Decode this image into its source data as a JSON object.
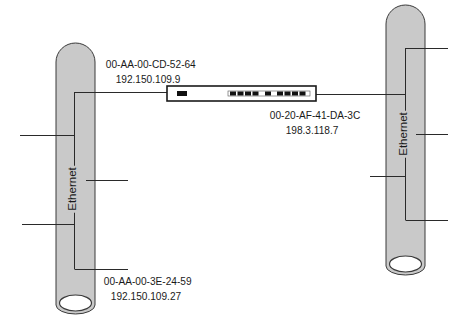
{
  "diagram": {
    "segments": [
      {
        "id": "left",
        "label": "Ethernet"
      },
      {
        "id": "right",
        "label": "Ethernet"
      }
    ],
    "switch": {
      "name": "switch",
      "ports": 11
    },
    "nodes": [
      {
        "mac": "00-AA-00-CD-52-64",
        "ip": "192.150.109.9"
      },
      {
        "mac": "00-20-AF-41-DA-3C",
        "ip": "198.3.118.7"
      },
      {
        "mac": "00-AA-00-3E-24-59",
        "ip": "192.150.109.27"
      }
    ],
    "colors": {
      "cable": "#c9c9c9",
      "line": "#2a2a2a",
      "background": "#ffffff"
    }
  }
}
